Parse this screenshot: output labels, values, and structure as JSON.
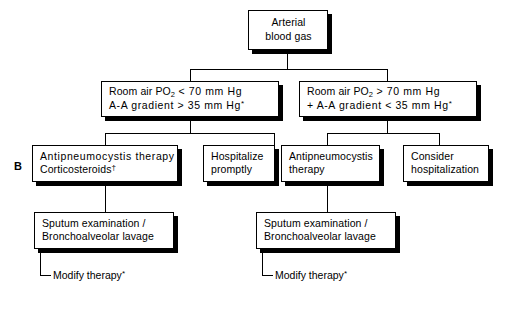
{
  "figure": {
    "panel_label": "B",
    "type": "clinical-decision-flowchart"
  },
  "nodes": {
    "root": {
      "line1": "Arterial",
      "line2": "blood gas"
    },
    "branch_left": {
      "line1_a": "Room air PO",
      "line1_sub": "2",
      "line1_b": " < 70 mm Hg",
      "line2": "A-A gradient > 35 mm Hg",
      "line2_mark": "*"
    },
    "branch_right": {
      "line1_a": "Room air PO",
      "line1_sub": "2",
      "line1_b": " > 70 mm Hg",
      "line2": "+ A-A gradient < 35 mm Hg",
      "line2_mark": "*"
    },
    "left_treatment": {
      "line1": "Antipneumocystis therapy",
      "line2": "Corticosteroids",
      "line2_mark": "†"
    },
    "hospitalize": {
      "line1": "Hospitalize",
      "line2": "promptly"
    },
    "right_treatment": {
      "line1": "Antipneumocystis",
      "line2": "therapy"
    },
    "consider_hospitalization": {
      "line1": "Consider",
      "line2": "hospitalization"
    },
    "left_sputum": {
      "line1": "Sputum examination /",
      "line2": "Bronchoalveolar lavage"
    },
    "right_sputum": {
      "line1": "Sputum examination /",
      "line2": "Bronchoalveolar lavage"
    }
  },
  "terminals": {
    "left_modify": {
      "text": "Modify therapy",
      "mark": "*"
    },
    "right_modify": {
      "text": "Modify therapy",
      "mark": "*"
    }
  },
  "colors": {
    "ink": "#000000",
    "paper": "#ffffff",
    "shadow": "#000000"
  }
}
